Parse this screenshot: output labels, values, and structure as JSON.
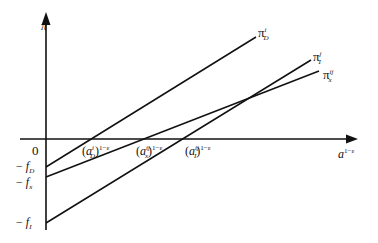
{
  "diagram": {
    "y_axis_label": "π",
    "x_axis_label": {
      "base": "a",
      "exp": "1−ε"
    },
    "origin_label": "0",
    "intercepts": [
      {
        "sign": "−",
        "sym": "f",
        "sub": "D"
      },
      {
        "sign": "−",
        "sym": "f",
        "sub": "x"
      },
      {
        "sign": "−",
        "sym": "f",
        "sub": "I"
      }
    ],
    "cutoffs": [
      {
        "sym": "a",
        "sup": "i",
        "sub": "D",
        "exp": "1−ε"
      },
      {
        "sym": "a",
        "sup": "ij",
        "sub": "x",
        "exp": "1−ε"
      },
      {
        "sym": "a",
        "sup": "ij",
        "sub": "I",
        "exp": "1−ε"
      }
    ],
    "lines": [
      {
        "name": "pi-D",
        "sym": "π",
        "sup": "i",
        "sub": "D"
      },
      {
        "name": "pi-I",
        "sym": "π",
        "sup": "j",
        "sub": "I"
      },
      {
        "name": "pi-x",
        "sym": "π",
        "sup": "ij",
        "sub": "x"
      }
    ],
    "line_color": "#111111"
  }
}
